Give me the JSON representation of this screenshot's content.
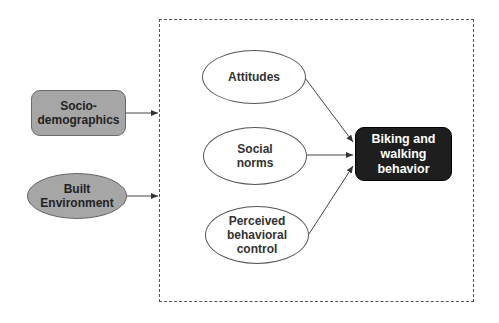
{
  "diagram": {
    "frame": {
      "style": "dashed",
      "color": "#555555"
    },
    "nodes": {
      "socio": {
        "label": "Socio-\ndemographics",
        "shape": "rounded-rectangle",
        "fill": "#a6a6a6"
      },
      "built": {
        "label": "Built\nEnvironment",
        "shape": "ellipse",
        "fill": "#a6a6a6"
      },
      "attitudes": {
        "label": "Attitudes",
        "shape": "ellipse",
        "fill": "#ffffff"
      },
      "social_norms": {
        "label": "Social\nnorms",
        "shape": "ellipse",
        "fill": "#ffffff"
      },
      "pbc": {
        "label": "Perceived\nbehavioral\ncontrol",
        "shape": "ellipse",
        "fill": "#ffffff"
      },
      "outcome": {
        "label": "Biking and\nwalking\nbehavior",
        "shape": "rounded-rectangle",
        "fill": "#1e1e1e"
      }
    },
    "edges": [
      {
        "from": "Socio-demographics",
        "to": "dashed frame"
      },
      {
        "from": "Built Environment",
        "to": "dashed frame"
      },
      {
        "from": "Attitudes",
        "to": "Biking and walking behavior"
      },
      {
        "from": "Social norms",
        "to": "Biking and walking behavior"
      },
      {
        "from": "Perceived behavioral control",
        "to": "Biking and walking behavior"
      }
    ]
  }
}
